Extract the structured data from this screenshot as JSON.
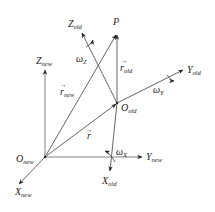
{
  "diagram": {
    "new_frame": {
      "origin": {
        "main": "O",
        "sub": "new"
      },
      "x_axis": {
        "main": "X",
        "sub": "new"
      },
      "y_axis": {
        "main": "Y",
        "sub": "new"
      },
      "z_axis": {
        "main": "Z",
        "sub": "new"
      }
    },
    "old_frame": {
      "origin": {
        "main": "O",
        "sub": "old"
      },
      "x_axis": {
        "main": "X",
        "sub": "old"
      },
      "y_axis": {
        "main": "Y",
        "sub": "old"
      },
      "z_axis": {
        "main": "Z",
        "sub": "old"
      }
    },
    "point": {
      "label": "P"
    },
    "vectors": {
      "r_new": {
        "main": "r",
        "sub": "new",
        "arrow": "→"
      },
      "r_old": {
        "main": "r",
        "sub": "old",
        "arrow": "→"
      },
      "r": {
        "main": "r",
        "arrow": "→"
      }
    },
    "rotations": {
      "omega_x": {
        "main": "ω",
        "sub": "X"
      },
      "omega_y": {
        "main": "ω",
        "sub": "Y"
      },
      "omega_z": {
        "main": "ω",
        "sub": "Z"
      }
    },
    "colors": {
      "line": "#555555",
      "text": "#222222",
      "background": "#ffffff"
    }
  }
}
